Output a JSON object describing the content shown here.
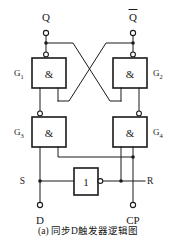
{
  "figure": {
    "caption": "(a) 同步D触发器逻辑图",
    "title": "同步D触发器逻辑图"
  },
  "diagram_data": {
    "type": "logic-circuit",
    "description": "Synchronous D flip-flop logic diagram built from four NAND gates and one inverter",
    "gates": [
      {
        "id": "G1",
        "label": "G1",
        "label_base": "G",
        "label_sub": "1",
        "symbol": "&",
        "kind": "NAND",
        "label_side": "left",
        "x": 32,
        "y": 58,
        "w": 34,
        "h": 30
      },
      {
        "id": "G2",
        "label": "G2",
        "label_base": "G",
        "label_sub": "2",
        "symbol": "&",
        "kind": "NAND",
        "label_side": "right",
        "x": 113,
        "y": 58,
        "w": 34,
        "h": 30
      },
      {
        "id": "G3",
        "label": "G3",
        "label_base": "G",
        "label_sub": "3",
        "symbol": "&",
        "kind": "NAND",
        "label_side": "left",
        "x": 32,
        "y": 117,
        "w": 34,
        "h": 30
      },
      {
        "id": "G4",
        "label": "G4",
        "label_base": "G",
        "label_sub": "4",
        "symbol": "&",
        "kind": "NAND",
        "label_side": "right",
        "x": 113,
        "y": 117,
        "w": 34,
        "h": 30
      }
    ],
    "inverter": {
      "id": "NOT1",
      "symbol": "1",
      "kind": "NOT",
      "x": 74,
      "y": 168,
      "w": 24,
      "h": 27
    },
    "terminals": [
      {
        "name": "Q",
        "label": "Q",
        "overbar": false,
        "x": 46,
        "y": 33,
        "label_x": 46,
        "label_y": 16
      },
      {
        "name": "Qbar",
        "label": "Q",
        "overbar": true,
        "x": 133,
        "y": 33,
        "label_x": 133,
        "label_y": 16
      },
      {
        "name": "D",
        "label": "D",
        "overbar": false,
        "x": 46,
        "y": 205,
        "label_x": 46,
        "label_y": 220
      },
      {
        "name": "CP",
        "label": "CP",
        "overbar": false,
        "x": 133,
        "y": 205,
        "label_x": 133,
        "label_y": 220
      }
    ],
    "node_labels": [
      {
        "name": "S",
        "label": "S",
        "x": 26,
        "y": 181
      },
      {
        "name": "R",
        "label": "R",
        "x": 152,
        "y": 181
      }
    ],
    "nets": [
      "Q output node feeds G2 lower-left input (cross-coupled)",
      "Qbar output node feeds G1 lower-right input (cross-coupled)",
      "G1 output -> G3 is above: G3 output -> G1 left input",
      "G4 output -> G2 right input",
      "S node ties D input line to G3 left input and inverter input",
      "R node ties inverter output and CP line to G4 right input"
    ]
  }
}
